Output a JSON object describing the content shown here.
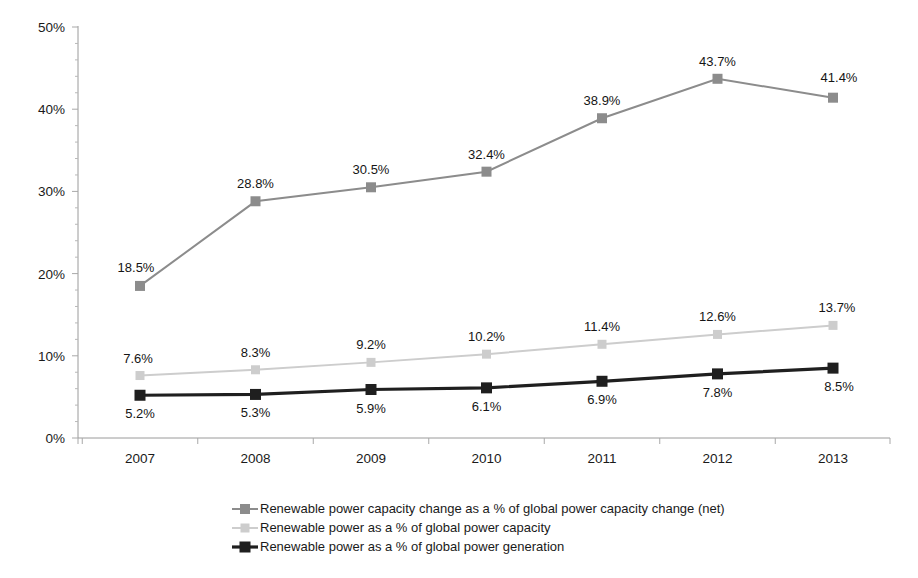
{
  "chart_data": {
    "type": "line",
    "title": "",
    "xlabel": "",
    "ylabel": "",
    "categories": [
      "2007",
      "2008",
      "2009",
      "2010",
      "2011",
      "2012",
      "2013"
    ],
    "ylim": [
      0,
      50
    ],
    "ytick_labels": [
      "0%",
      "10%",
      "20%",
      "30%",
      "40%",
      "50%"
    ],
    "ytick_values": [
      0,
      10,
      20,
      30,
      40,
      50
    ],
    "grid": false,
    "legend_position": "bottom",
    "series": [
      {
        "name": "Renewable power capacity change as a % of global power capacity change (net)",
        "color": "#8c8c8c",
        "marker": "square",
        "values": [
          18.5,
          28.8,
          30.5,
          32.4,
          38.9,
          43.7,
          41.4
        ],
        "data_labels": [
          "18.5%",
          "28.8%",
          "30.5%",
          "32.4%",
          "38.9%",
          "43.7%",
          "41.4%"
        ],
        "label_position": "above"
      },
      {
        "name": "Renewable power as a % of global power capacity",
        "color": "#cdcdcd",
        "marker": "square",
        "values": [
          7.6,
          8.3,
          9.2,
          10.2,
          11.4,
          12.6,
          13.7
        ],
        "data_labels": [
          "7.6%",
          "8.3%",
          "9.2%",
          "10.2%",
          "11.4%",
          "12.6%",
          "13.7%"
        ],
        "label_position": "above"
      },
      {
        "name": "Renewable power as a % of global power generation",
        "color": "#1f1f1f",
        "marker": "square",
        "values": [
          5.2,
          5.3,
          5.9,
          6.1,
          6.9,
          7.8,
          8.5
        ],
        "data_labels": [
          "5.2%",
          "5.3%",
          "5.9%",
          "6.1%",
          "6.9%",
          "7.8%",
          "8.5%"
        ],
        "label_position": "below"
      }
    ],
    "legend": [
      {
        "label": "Renewable power capacity change as a % of global power capacity change (net)",
        "color": "#8c8c8c"
      },
      {
        "label": "Renewable power as a % of global power capacity",
        "color": "#cdcdcd"
      },
      {
        "label": "Renewable power as a % of global power generation",
        "color": "#1f1f1f"
      }
    ]
  }
}
